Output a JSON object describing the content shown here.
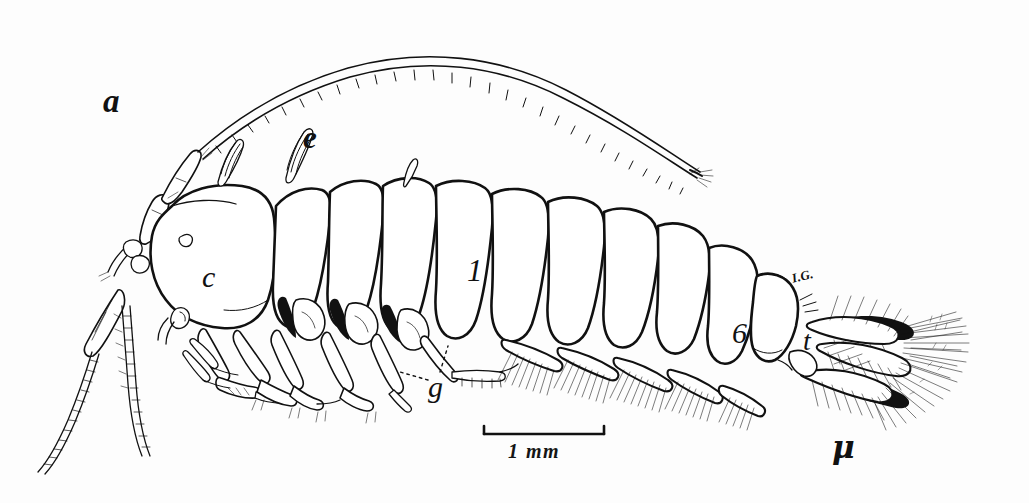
{
  "figure": {
    "kind": "scientific-line-drawing",
    "orientation": "lateral, head to the left",
    "ink_color": "#111111",
    "paper_color": "#fdfdfd"
  },
  "labels": [
    {
      "key": "a",
      "text": "a",
      "meaning": "antenna",
      "x": 103,
      "y": 85
    },
    {
      "key": "e",
      "text": "e",
      "meaning": "eye-or-dorsal-process",
      "x": 303,
      "y": 122
    },
    {
      "key": "c",
      "text": "c",
      "meaning": "cephalon-head",
      "x": 202,
      "y": 262
    },
    {
      "key": "seg1",
      "text": "1",
      "meaning": "first-pereonite",
      "x": 467,
      "y": 255
    },
    {
      "key": "seg6",
      "text": "6",
      "meaning": "sixth-pereonite",
      "x": 732,
      "y": 318
    },
    {
      "key": "t",
      "text": "t",
      "meaning": "telson",
      "x": 803,
      "y": 327
    },
    {
      "key": "g",
      "text": "g",
      "meaning": "gnathopod-or-gill",
      "x": 428,
      "y": 372
    },
    {
      "key": "mu",
      "text": "μ",
      "meaning": "uropod-ramus",
      "x": 832,
      "y": 432
    },
    {
      "key": "ig",
      "text": "I.G.",
      "meaning": "artist-initials",
      "x": 792,
      "y": 272
    }
  ],
  "scale_bar": {
    "text": "1  mm",
    "value": 1,
    "unit": "mm",
    "bar_x_start": 484,
    "bar_x_end": 604,
    "bar_y": 434
  }
}
